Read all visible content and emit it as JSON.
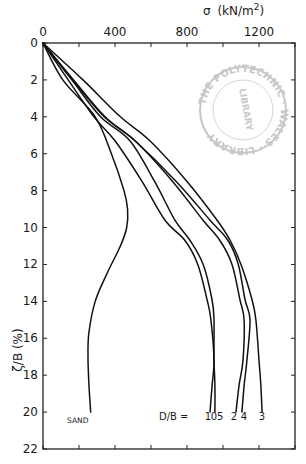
{
  "chart_data": {
    "type": "line",
    "title": "",
    "xlabel": "σ (kN/m²)",
    "ylabel": "ζ/B (%)",
    "x_axis_position": "top",
    "y_axis_inverted": true,
    "xlim": [
      0,
      1400
    ],
    "ylim": [
      0,
      22
    ],
    "x_ticks": [
      0,
      400,
      800,
      1200
    ],
    "x_minor_ticks": [
      200,
      600,
      1000,
      1400
    ],
    "y_ticks": [
      0,
      2,
      4,
      6,
      8,
      10,
      12,
      14,
      16,
      18,
      20,
      22
    ],
    "grid": false,
    "legend_prefix": "D/B =",
    "series": [
      {
        "name": "SAND",
        "label": "SAND",
        "points": [
          [
            0,
            0
          ],
          [
            110,
            2
          ],
          [
            290,
            4
          ],
          [
            380,
            6
          ],
          [
            450,
            8
          ],
          [
            470,
            9
          ],
          [
            465,
            10
          ],
          [
            430,
            11
          ],
          [
            355,
            12.5
          ],
          [
            290,
            14
          ],
          [
            255,
            15.7
          ],
          [
            250,
            17
          ],
          [
            255,
            18.5
          ],
          [
            265,
            20
          ]
        ]
      },
      {
        "name": "D/B = 1",
        "label": "1",
        "points": [
          [
            0,
            0
          ],
          [
            140,
            2
          ],
          [
            283,
            4
          ],
          [
            400,
            5.3
          ],
          [
            550,
            7.5
          ],
          [
            678,
            9.6
          ],
          [
            789,
            10.7
          ],
          [
            860,
            12
          ],
          [
            911,
            13.9
          ],
          [
            933,
            15
          ],
          [
            950,
            17.2
          ],
          [
            940,
            18.5
          ],
          [
            928,
            20
          ]
        ]
      },
      {
        "name": "D/B = 0.5",
        "label": "0.5",
        "points": [
          [
            0,
            0
          ],
          [
            160,
            2
          ],
          [
            320,
            4
          ],
          [
            483,
            5.3
          ],
          [
            620,
            7.5
          ],
          [
            733,
            9.6
          ],
          [
            817,
            10.7
          ],
          [
            890,
            12
          ],
          [
            939,
            13.9
          ],
          [
            950,
            15
          ],
          [
            950,
            17.2
          ],
          [
            955,
            18.5
          ],
          [
            955,
            20
          ]
        ]
      },
      {
        "name": "D/B = 2",
        "label": "2",
        "points": [
          [
            0,
            0
          ],
          [
            165,
            2
          ],
          [
            340,
            4
          ],
          [
            511,
            5.3
          ],
          [
            720,
            7.5
          ],
          [
            889,
            9.6
          ],
          [
            983,
            10.7
          ],
          [
            1050,
            12
          ],
          [
            1094,
            13.9
          ],
          [
            1117,
            15
          ],
          [
            1111,
            17.2
          ],
          [
            1090,
            18.5
          ],
          [
            1072,
            20
          ]
        ]
      },
      {
        "name": "D/B = 4",
        "label": "4",
        "points": [
          [
            0,
            0
          ],
          [
            170,
            2
          ],
          [
            345,
            4
          ],
          [
            511,
            5.3
          ],
          [
            740,
            7.5
          ],
          [
            928,
            9.6
          ],
          [
            1028,
            10.7
          ],
          [
            1085,
            12
          ],
          [
            1122,
            13.9
          ],
          [
            1150,
            15
          ],
          [
            1133,
            17.2
          ],
          [
            1118,
            18.5
          ],
          [
            1105,
            20
          ]
        ]
      },
      {
        "name": "D/B = 3",
        "label": "3",
        "points": [
          [
            0,
            0
          ],
          [
            222,
            2
          ],
          [
            430,
            4
          ],
          [
            594,
            5.3
          ],
          [
            800,
            7.5
          ],
          [
            967,
            9.6
          ],
          [
            1040,
            10.7
          ],
          [
            1100,
            12
          ],
          [
            1161,
            13.9
          ],
          [
            1183,
            15
          ],
          [
            1200,
            17.2
          ],
          [
            1210,
            18.5
          ],
          [
            1217,
            20
          ]
        ]
      }
    ],
    "annotations": [
      "SAND",
      "D/B =",
      "1",
      "0.5",
      "2",
      "4",
      "3"
    ]
  },
  "labels": {
    "x_title_sigma": "σ",
    "x_title_units": "(kN/m",
    "x_title_sup": "2",
    "x_title_close": ")",
    "y_title": "ζ/B (%)",
    "sand": "SAND",
    "db_prefix": "D/B =",
    "db_values": [
      "1",
      "0.5",
      "2",
      "4",
      "3"
    ],
    "db_display": "1 05  2 4    3"
  },
  "stamp": {
    "top_text": "THE POLYTECHNIC",
    "bottom_text": "WALES · LIBRARY",
    "center_text": "LIBRARY",
    "color": "#9a9a9a"
  }
}
